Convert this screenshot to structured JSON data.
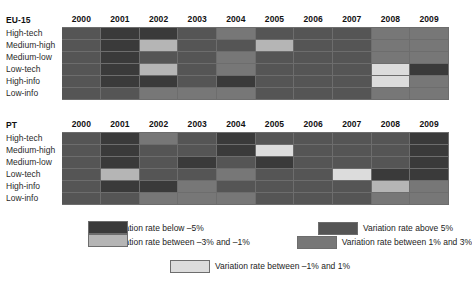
{
  "colors": {
    "below_minus5": "#3a3a3a",
    "between_minus3_minus1": "#b5b5b5",
    "above_5": "#555555",
    "between_1_3": "#777777",
    "between_minus1_1": "#dcdcdc",
    "grid_border": "#6d6d6d"
  },
  "legend": {
    "items": [
      {
        "key": "below_minus5",
        "label": "Variation rate below –5%"
      },
      {
        "key": "above_5",
        "label": "Variation rate above 5%"
      },
      {
        "key": "between_minus3_minus1",
        "label": "Variation rate between –3% and –1%"
      },
      {
        "key": "between_1_3",
        "label": "Variation rate between 1% and 3%"
      },
      {
        "key": "between_minus1_1",
        "label": "Variation rate between –1% and 1%"
      }
    ]
  },
  "years": [
    "2000",
    "2001",
    "2002",
    "2003",
    "2004",
    "2005",
    "2006",
    "2007",
    "2008",
    "2009"
  ],
  "rows": [
    "High-tech",
    "Medium-high",
    "Medium-low",
    "Low-tech",
    "High-info",
    "Low-info"
  ],
  "chart_data": {
    "type": "heatmap",
    "title": "",
    "xlabel": "",
    "ylabel": "",
    "x": [
      "2000",
      "2001",
      "2002",
      "2003",
      "2004",
      "2005",
      "2006",
      "2007",
      "2008",
      "2009"
    ],
    "y": [
      "High-tech",
      "Medium-high",
      "Medium-low",
      "Low-tech",
      "High-info",
      "Low-info"
    ],
    "legend_position": "bottom",
    "categories": [
      "Variation rate below –5%",
      "Variation rate between –3% and –1%",
      "Variation rate between –1% and 1%",
      "Variation rate between 1% and 3%",
      "Variation rate above 5%"
    ],
    "panels": [
      {
        "name": "EU-15",
        "matrix": [
          [
            "above_5",
            "below_minus5",
            "below_minus5",
            "above_5",
            "between_1_3",
            "above_5",
            "above_5",
            "above_5",
            "between_1_3",
            "between_1_3"
          ],
          [
            "above_5",
            "below_minus5",
            "between_minus3_minus1",
            "above_5",
            "above_5",
            "between_minus3_minus1",
            "above_5",
            "above_5",
            "between_1_3",
            "between_1_3"
          ],
          [
            "above_5",
            "below_minus5",
            "above_5",
            "above_5",
            "between_1_3",
            "above_5",
            "above_5",
            "above_5",
            "between_1_3",
            "between_1_3"
          ],
          [
            "above_5",
            "below_minus5",
            "between_minus3_minus1",
            "above_5",
            "between_1_3",
            "above_5",
            "above_5",
            "above_5",
            "between_minus1_1",
            "below_minus5"
          ],
          [
            "above_5",
            "below_minus5",
            "below_minus5",
            "above_5",
            "below_minus5",
            "above_5",
            "above_5",
            "above_5",
            "between_minus1_1",
            "between_1_3"
          ],
          [
            "above_5",
            "above_5",
            "between_1_3",
            "between_1_3",
            "between_1_3",
            "above_5",
            "above_5",
            "above_5",
            "between_1_3",
            "between_1_3"
          ]
        ]
      },
      {
        "name": "PT",
        "matrix": [
          [
            "above_5",
            "below_minus5",
            "between_1_3",
            "above_5",
            "below_minus5",
            "above_5",
            "above_5",
            "above_5",
            "above_5",
            "below_minus5"
          ],
          [
            "above_5",
            "below_minus5",
            "above_5",
            "above_5",
            "below_minus5",
            "between_minus1_1",
            "above_5",
            "above_5",
            "above_5",
            "below_minus5"
          ],
          [
            "above_5",
            "below_minus5",
            "above_5",
            "below_minus5",
            "above_5",
            "below_minus5",
            "above_5",
            "above_5",
            "above_5",
            "below_minus5"
          ],
          [
            "above_5",
            "between_minus3_minus1",
            "above_5",
            "above_5",
            "between_1_3",
            "above_5",
            "above_5",
            "between_minus1_1",
            "below_minus5",
            "below_minus5"
          ],
          [
            "above_5",
            "below_minus5",
            "below_minus5",
            "between_1_3",
            "above_5",
            "above_5",
            "above_5",
            "above_5",
            "between_minus3_minus1",
            "between_1_3"
          ],
          [
            "above_5",
            "above_5",
            "between_1_3",
            "between_1_3",
            "between_1_3",
            "above_5",
            "above_5",
            "above_5",
            "between_1_3",
            "between_1_3"
          ]
        ]
      }
    ]
  }
}
